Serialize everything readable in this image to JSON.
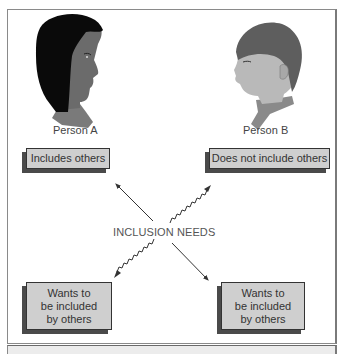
{
  "diagram": {
    "persons": [
      {
        "id": "A",
        "label": "Person A",
        "box_label": "Includes others"
      },
      {
        "id": "B",
        "label": "Person B",
        "box_label": "Does not include others"
      }
    ],
    "center_label": "INCLUSION NEEDS",
    "bottom_boxes": [
      {
        "lines": [
          "Wants to",
          "be included",
          "by others"
        ]
      },
      {
        "lines": [
          "Wants to",
          "be included",
          "by others"
        ]
      }
    ],
    "arrows": [
      {
        "from": "center",
        "to": "person-a-box",
        "style": "solid"
      },
      {
        "from": "center",
        "to": "person-b-box",
        "style": "wavy"
      },
      {
        "from": "center",
        "to": "bottom-left-box",
        "style": "wavy"
      },
      {
        "from": "center",
        "to": "bottom-right-box",
        "style": "solid"
      }
    ],
    "colors": {
      "box_fill": "#cfcfcf",
      "box_shadow": "#4a4a4a",
      "frame": "#8a8a8a",
      "person_a_hair": "#0a0a0a",
      "person_a_skin": "#6b6b6b",
      "person_b_hair": "#5e5e5e",
      "person_b_skin": "#b9b9b9"
    }
  }
}
